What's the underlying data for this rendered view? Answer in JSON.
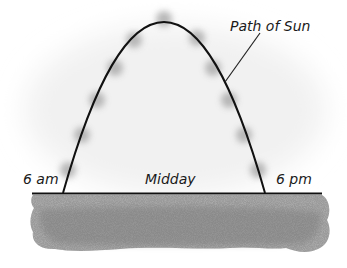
{
  "diagram": {
    "labels": {
      "path_of_sun": "Path of Sun",
      "morning": "6 am",
      "midday": "Midday",
      "evening": "6 pm"
    },
    "colors": {
      "path_stroke": "#111111",
      "sun_dot": "#a9a9a9",
      "ground_fill": "#8e8e8e",
      "ground_line": "#111111",
      "background_haze": "#f2f2f2"
    },
    "sun_positions": [
      {
        "x": 68,
        "y": 170
      },
      {
        "x": 82,
        "y": 135
      },
      {
        "x": 97,
        "y": 100
      },
      {
        "x": 115,
        "y": 68
      },
      {
        "x": 134,
        "y": 40
      },
      {
        "x": 164,
        "y": 19
      },
      {
        "x": 197,
        "y": 38
      },
      {
        "x": 213,
        "y": 68
      },
      {
        "x": 229,
        "y": 100
      },
      {
        "x": 244,
        "y": 135
      },
      {
        "x": 258,
        "y": 170
      }
    ]
  }
}
